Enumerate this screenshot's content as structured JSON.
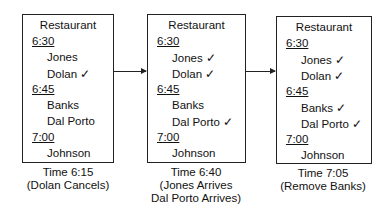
{
  "panels": [
    {
      "title": "Restaurant",
      "slots": [
        {
          "time": "6:30",
          "guests": [
            {
              "name": "Jones",
              "checked": false
            },
            {
              "name": "Dolan",
              "checked": true
            }
          ]
        },
        {
          "time": "6:45",
          "guests": [
            {
              "name": "Banks",
              "checked": false
            },
            {
              "name": "Dal Porto",
              "checked": false
            }
          ]
        },
        {
          "time": "7:00",
          "guests": [
            {
              "name": "Johnson",
              "checked": false
            }
          ]
        }
      ],
      "caption_line1": "Time 6:15",
      "caption_line2": "(Dolan Cancels)",
      "caption_line3": ""
    },
    {
      "title": "Restaurant",
      "slots": [
        {
          "time": "6:30",
          "guests": [
            {
              "name": "Jones",
              "checked": true
            },
            {
              "name": "Dolan",
              "checked": true
            }
          ]
        },
        {
          "time": "6:45",
          "guests": [
            {
              "name": "Banks",
              "checked": false
            },
            {
              "name": "Dal Porto",
              "checked": true
            }
          ]
        },
        {
          "time": "7:00",
          "guests": [
            {
              "name": "Johnson",
              "checked": false
            }
          ]
        }
      ],
      "caption_line1": "Time 6:40",
      "caption_line2": "(Jones Arrives",
      "caption_line3": "Dal Porto Arrives)"
    },
    {
      "title": "Restaurant",
      "slots": [
        {
          "time": "6:30",
          "guests": [
            {
              "name": "Jones",
              "checked": true
            },
            {
              "name": "Dolan",
              "checked": true
            }
          ]
        },
        {
          "time": "6:45",
          "guests": [
            {
              "name": "Banks",
              "checked": true
            },
            {
              "name": "Dal Porto",
              "checked": true
            }
          ]
        },
        {
          "time": "7:00",
          "guests": [
            {
              "name": "Johnson",
              "checked": false
            }
          ]
        }
      ],
      "caption_line1": "Time 7:05",
      "caption_line2": "(Remove Banks)",
      "caption_line3": ""
    }
  ],
  "check_glyph": "✓"
}
